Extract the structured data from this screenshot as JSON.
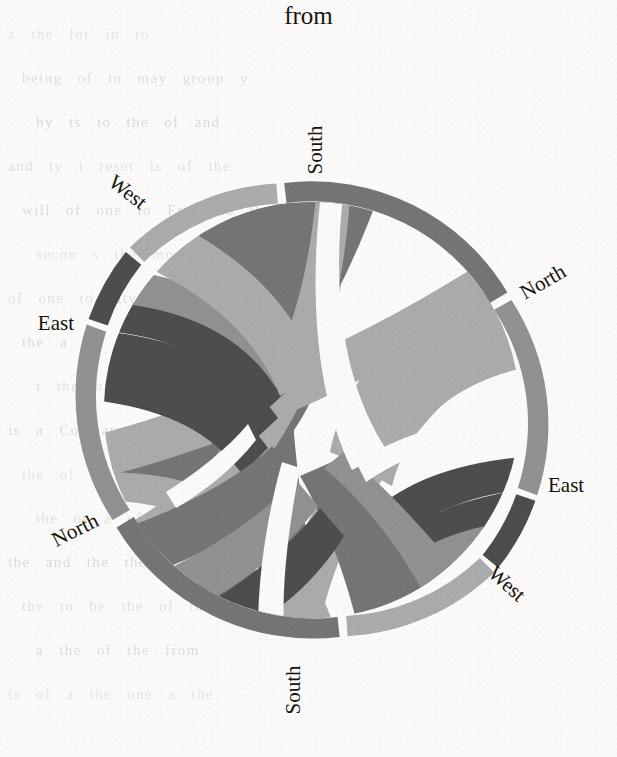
{
  "title": "from",
  "figure": {
    "type": "chord-diagram",
    "center_x": 312,
    "center_y": 410,
    "outer_radius": 228,
    "ring_inner_radius": 208,
    "background_color": "#fbfaf8"
  },
  "palette": {
    "north": "#8f9193",
    "south": "#737577",
    "east": "#4c4e50",
    "west": "#a9abad",
    "gap": "#fbfaf8"
  },
  "labels": [
    {
      "text": "South",
      "id": "label-south-top",
      "x": 322,
      "y": 150,
      "rotate": -90,
      "anchor": "middle"
    },
    {
      "text": "North",
      "id": "label-north-right",
      "x": 525,
      "y": 300,
      "rotate": -30,
      "anchor": "start"
    },
    {
      "text": "East",
      "id": "label-east-right",
      "x": 548,
      "y": 492,
      "rotate": 0,
      "anchor": "start"
    },
    {
      "text": "West",
      "id": "label-west-right",
      "x": 487,
      "y": 575,
      "rotate": 42,
      "anchor": "start"
    },
    {
      "text": "South",
      "id": "label-south-bottom",
      "x": 300,
      "y": 690,
      "rotate": -90,
      "anchor": "middle"
    },
    {
      "text": "North",
      "id": "label-north-left",
      "x": 100,
      "y": 525,
      "rotate": -27,
      "anchor": "end"
    },
    {
      "text": "East",
      "id": "label-east-left",
      "x": 74,
      "y": 330,
      "rotate": 0,
      "anchor": "end"
    },
    {
      "text": "West",
      "id": "label-west-left",
      "x": 140,
      "y": 210,
      "rotate": 38,
      "anchor": "end"
    }
  ],
  "chart_data": {
    "type": "chord",
    "title": "from",
    "groups": [
      "South",
      "North",
      "East",
      "West",
      "South",
      "North",
      "East",
      "West"
    ],
    "categories": [
      "North",
      "South",
      "East",
      "West"
    ],
    "legend_position": "around-circle",
    "grid": false,
    "note": "Migration flow chord diagram; each of the four regions appears twice around the ring (origin arc and destination arc). Ribbon widths are proportional to flow volume between region pairs.",
    "arcs": [
      {
        "group": "South",
        "side": "top",
        "start_deg": -97,
        "end_deg": -31,
        "color": "#737577"
      },
      {
        "group": "North",
        "side": "upper-right",
        "start_deg": -29,
        "end_deg": 22,
        "color": "#8f9193"
      },
      {
        "group": "East",
        "side": "right",
        "start_deg": 24,
        "end_deg": 44,
        "color": "#4c4e50"
      },
      {
        "group": "West",
        "side": "lower-right",
        "start_deg": 46,
        "end_deg": 78,
        "color": "#a9abad"
      },
      {
        "group": "South",
        "side": "bottom",
        "start_deg": 83,
        "end_deg": 149,
        "color": "#737577"
      },
      {
        "group": "North",
        "side": "lower-left",
        "start_deg": 151,
        "end_deg": 202,
        "color": "#8f9193"
      },
      {
        "group": "East",
        "side": "left",
        "start_deg": 204,
        "end_deg": 224,
        "color": "#4c4e50"
      },
      {
        "group": "West",
        "side": "upper-left",
        "start_deg": 226,
        "end_deg": 258,
        "color": "#a9abad"
      }
    ],
    "flows": [
      {
        "source": "South",
        "target": "South",
        "value": 32,
        "color": "#737577"
      },
      {
        "source": "South",
        "target": "North",
        "value": 22,
        "color": "#8f9193"
      },
      {
        "source": "South",
        "target": "East",
        "value": 8,
        "color": "#4c4e50"
      },
      {
        "source": "South",
        "target": "West",
        "value": 12,
        "color": "#a9abad"
      },
      {
        "source": "North",
        "target": "South",
        "value": 18,
        "color": "#737577"
      },
      {
        "source": "North",
        "target": "North",
        "value": 26,
        "color": "#8f9193"
      },
      {
        "source": "North",
        "target": "East",
        "value": 6,
        "color": "#4c4e50"
      },
      {
        "source": "North",
        "target": "West",
        "value": 10,
        "color": "#a9abad"
      },
      {
        "source": "East",
        "target": "South",
        "value": 7,
        "color": "#737577"
      },
      {
        "source": "East",
        "target": "North",
        "value": 5,
        "color": "#8f9193"
      },
      {
        "source": "East",
        "target": "East",
        "value": 9,
        "color": "#4c4e50"
      },
      {
        "source": "East",
        "target": "West",
        "value": 4,
        "color": "#a9abad"
      },
      {
        "source": "West",
        "target": "South",
        "value": 11,
        "color": "#737577"
      },
      {
        "source": "West",
        "target": "North",
        "value": 9,
        "color": "#8f9193"
      },
      {
        "source": "West",
        "target": "East",
        "value": 4,
        "color": "#4c4e50"
      },
      {
        "source": "West",
        "target": "West",
        "value": 14,
        "color": "#a9abad"
      }
    ]
  },
  "background_text": {
    "lines": [
      "a  the  for  in  to",
      "being   of  to  may  group    y",
      "by   ts   to   the   of  and",
      "and   ty   i  reset   is   of    the",
      "will  of  one  to  From   to   the",
      "secon   s  the  movement  extent",
      "of  one  to  city  of  one  to  be",
      "the  a  the  of  one  thus",
      "t  the  of  a  of  one  to",
      "is  a  Compare  to  the",
      "the  of  the  and  to",
      "the  or  a  of  one",
      "the  and  the  the  of",
      "the  to  be  the  of  the",
      "a  the  of  the  from",
      "is  of  a  the  one  a  the"
    ]
  }
}
